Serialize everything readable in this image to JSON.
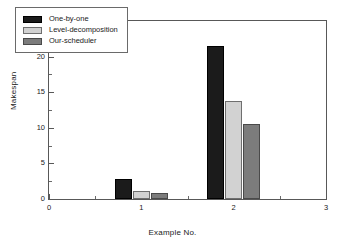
{
  "chart_data": {
    "type": "bar",
    "title": "",
    "xlabel": "Example No.",
    "ylabel": "Makespan",
    "categories": [
      "1",
      "2"
    ],
    "x": [
      1,
      2
    ],
    "series": [
      {
        "name": "One-by-one",
        "color": "#1b1b1b",
        "values": [
          2.8,
          21.5
        ]
      },
      {
        "name": "Level-decomposition",
        "color": "#d2d2d2",
        "values": [
          1.1,
          13.75
        ]
      },
      {
        "name": "Our-scheduler",
        "color": "#7c7c7c",
        "values": [
          0.85,
          10.6
        ]
      }
    ],
    "xlim": [
      0,
      3
    ],
    "ylim": [
      0,
      25
    ],
    "xticks": [
      "0",
      "1",
      "2",
      "3"
    ],
    "yticks": [
      "0",
      "5",
      "10",
      "15",
      "20",
      "25"
    ],
    "grid": false,
    "legend_position": "upper left",
    "frame": true
  },
  "legend": {
    "entries": [
      {
        "label": "One-by-one"
      },
      {
        "label": "Level-decomposition"
      },
      {
        "label": "Our-scheduler"
      }
    ]
  },
  "axes": {
    "y_title": "Makespan",
    "x_title": "Example No."
  }
}
